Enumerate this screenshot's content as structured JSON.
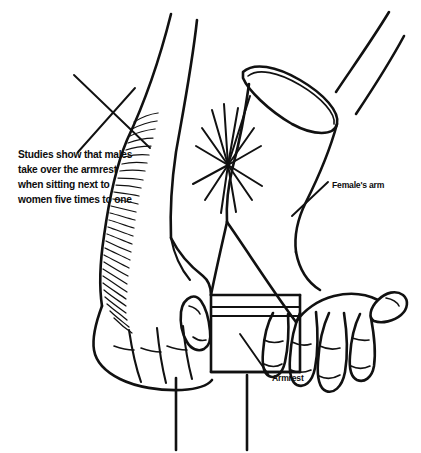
{
  "image": {
    "kind": "line-drawing-illustration",
    "subject": "two forearms competing for an armrest",
    "background_color": "#ffffff",
    "ink_color": "#111111",
    "width": 421,
    "height": 453
  },
  "annotations": {
    "fact_callout": {
      "name": "studies-callout",
      "lines": [
        "Studies show that males",
        "take over the armrest",
        "when sitting next to",
        "women five times to one"
      ],
      "x": 18,
      "y": 158
    },
    "female_arm_label": {
      "name": "female-arm-label",
      "text": "Female's arm",
      "x": 332,
      "y": 188
    },
    "armrest_label": {
      "name": "armrest-label",
      "text": "Armrest",
      "x": 272,
      "y": 381
    }
  },
  "parts": {
    "male_arm": "male-forearm-hairy",
    "male_hand": "male-hand-gripping-armrest",
    "female_arm": "female-forearm-with-sleeve-cuff",
    "female_hand": "female-hand-splayed-fingers",
    "armrest": "armrest-block",
    "armrest_posts": "armrest-support-posts",
    "impact": "impact-starburst"
  }
}
